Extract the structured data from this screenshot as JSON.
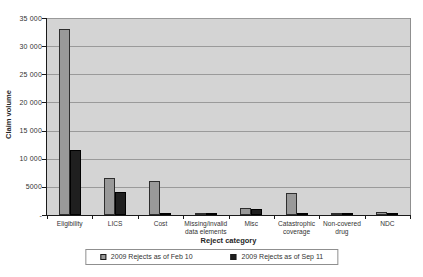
{
  "chart_data": {
    "type": "bar",
    "title": "",
    "xlabel": "Reject category",
    "ylabel": "Claim volume",
    "categories": [
      "Eligibility",
      "LICS",
      "Cost",
      "Missing/invalid data elements",
      "Misc",
      "Catastrophic coverage",
      "Non-covered drug",
      "NDC"
    ],
    "category_label_lines": [
      [
        "Eligibility"
      ],
      [
        "LICS"
      ],
      [
        "Cost"
      ],
      [
        "Missing/invalid",
        "data elements"
      ],
      [
        "Misc"
      ],
      [
        "Catastrophic",
        "coverage"
      ],
      [
        "Non-covered",
        "drug"
      ],
      [
        "NDC"
      ]
    ],
    "series": [
      {
        "name": "2009 Rejects as of Feb 10",
        "color": "#999999",
        "border": "#2e2e2e",
        "values": [
          33000,
          6500,
          6000,
          300,
          1300,
          3900,
          100,
          600
        ]
      },
      {
        "name": "2009 Rejects as of Sep 11",
        "color": "#1f1f1f",
        "border": "#000000",
        "values": [
          11500,
          4000,
          400,
          250,
          1000,
          200,
          50,
          150
        ]
      }
    ],
    "ylim": [
      0,
      35000
    ],
    "ytick_interval": 5000,
    "ytick_labels": [
      "-",
      "5000",
      "10 000",
      "15 000",
      "20 000",
      "25 000",
      "30 000",
      "35 000"
    ],
    "grid": true,
    "legend_position": "bottom",
    "plot_background": "#d4d4d4",
    "gridline_color": "#9a9a9a"
  }
}
